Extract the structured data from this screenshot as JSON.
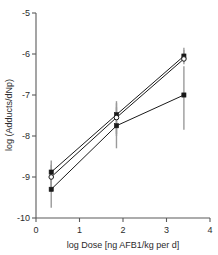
{
  "chart_data": {
    "type": "line",
    "title": "",
    "subtitle": "",
    "xlabel": "log Dose [ng AFB1/kg per d]",
    "ylabel": "log (Adducts/dNp)",
    "xlim": [
      0,
      4
    ],
    "ylim": [
      -10,
      -5
    ],
    "xticks": [
      0,
      1,
      2,
      3,
      4
    ],
    "xtick_labels": [
      "0",
      "1",
      "2",
      "3",
      "4"
    ],
    "yticks": [
      -10,
      -9,
      -8,
      -7,
      -6,
      -5
    ],
    "ytick_labels": [
      "-10",
      "-9",
      "-8",
      "-7",
      "-6",
      "-5"
    ],
    "grid": false,
    "legend": "none",
    "x": [
      0.35,
      1.85,
      3.4
    ],
    "series": [
      {
        "name": "series-1",
        "marker": "filled-square",
        "values": [
          -8.88,
          -7.48,
          -6.05
        ],
        "err_low": [
          -9.25,
          -7.95,
          -6.2
        ],
        "err_high": [
          -8.6,
          -7.15,
          -5.85
        ]
      },
      {
        "name": "series-2",
        "marker": "open-circle",
        "values": [
          -9.0,
          -7.55,
          -6.12
        ],
        "err_low": [
          -9.3,
          -8.0,
          -6.25
        ],
        "err_high": [
          -8.7,
          -7.2,
          -5.9
        ]
      },
      {
        "name": "series-3",
        "marker": "filled-square",
        "values": [
          -9.3,
          -7.75,
          -7.0
        ],
        "err_low": [
          -9.75,
          -8.3,
          -7.85
        ],
        "err_high": [
          -9.05,
          -7.3,
          -6.3
        ]
      }
    ]
  },
  "axes": {
    "x_axis_name": "x-axis",
    "y_axis_name": "y-axis"
  }
}
